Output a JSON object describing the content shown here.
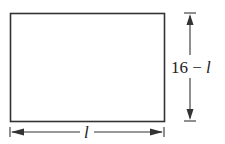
{
  "diagram": {
    "shape": "rectangle",
    "width_label": {
      "prefix": "",
      "variable": "l"
    },
    "height_label": {
      "prefix": "16 − ",
      "variable": "l"
    },
    "stroke_color": "#333333"
  }
}
